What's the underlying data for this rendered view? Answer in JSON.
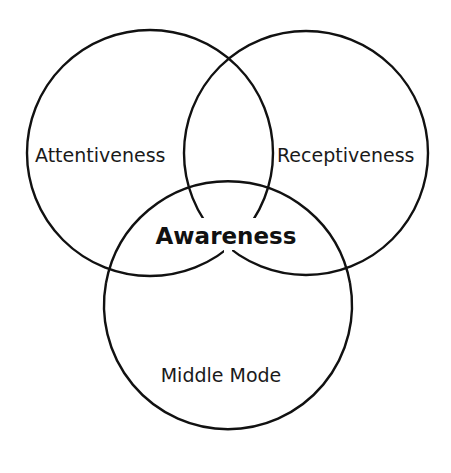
{
  "diagram": {
    "type": "venn",
    "stroke_color": "#111111",
    "background": "#ffffff",
    "sets": [
      {
        "id": "attentiveness",
        "label": "Attentiveness",
        "cx": 150,
        "cy": 153,
        "r": 123
      },
      {
        "id": "receptiveness",
        "label": "Receptiveness",
        "cx": 306,
        "cy": 153,
        "r": 122
      },
      {
        "id": "middle-mode",
        "label": "Middle Mode",
        "cx": 228,
        "cy": 316,
        "r": 124
      }
    ],
    "intersection": {
      "label": "Awareness"
    }
  }
}
